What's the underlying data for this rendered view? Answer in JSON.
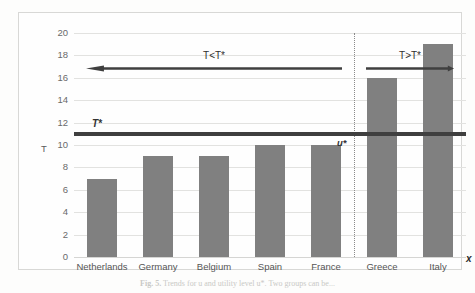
{
  "figure": {
    "caption_prefix": "Fig. 5.",
    "caption_text": "Trends for u and utility level u*. Two groups can be...",
    "x_axis_title": "x",
    "y_axis_title": "T"
  },
  "chart_data": {
    "type": "bar",
    "title": "",
    "xlabel": "x",
    "ylabel": "T",
    "categories": [
      "Netherlands",
      "Germany",
      "Belgium",
      "Spain",
      "France",
      "Greece",
      "Italy"
    ],
    "values": [
      7,
      9,
      9,
      10,
      10,
      16,
      19
    ],
    "ylim": [
      0,
      20
    ],
    "ytick_values": [
      0,
      2,
      4,
      6,
      8,
      10,
      12,
      14,
      16,
      18,
      20
    ],
    "ytick_labels": [
      "0",
      "2",
      "4",
      "6",
      "8",
      "10",
      "12",
      "14",
      "16",
      "18",
      "20"
    ],
    "grid": true,
    "legend": "none",
    "bar_color": "#808080",
    "reference_lines": [
      {
        "name": "T-star",
        "label": "T*",
        "value": 11,
        "orientation": "horizontal",
        "color": "#3f3f3f",
        "style": "thick-solid"
      },
      {
        "name": "group-divider",
        "label": "u*",
        "between": [
          "France",
          "Greece"
        ],
        "orientation": "vertical",
        "color": "#8a8a8a",
        "style": "dotted"
      }
    ],
    "annotations": [
      {
        "name": "left-group",
        "label": "T<T*",
        "arrow_direction": "left",
        "covers": [
          "Netherlands",
          "Germany",
          "Belgium",
          "Spain",
          "France"
        ]
      },
      {
        "name": "right-group",
        "label": "T>T*",
        "arrow_direction": "right",
        "covers": [
          "Greece",
          "Italy"
        ]
      }
    ]
  }
}
